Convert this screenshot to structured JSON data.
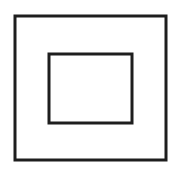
{
  "symbol": {
    "name": "double-insulation-symbol",
    "description": "Class II equipment symbol: a square nested inside a larger square",
    "stroke_color": "#1e1e1e",
    "background_color": "#ffffff",
    "outer_square": {
      "x": 15,
      "y": 16,
      "width": 151,
      "height": 144,
      "stroke_width": 3
    },
    "inner_square": {
      "x": 49,
      "y": 54,
      "width": 83,
      "height": 69,
      "stroke_width": 3
    }
  }
}
